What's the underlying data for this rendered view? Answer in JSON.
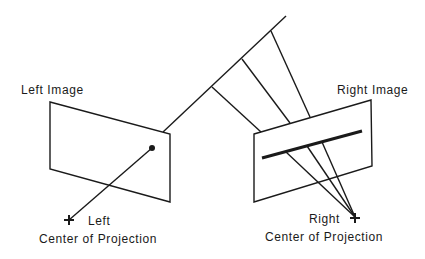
{
  "labels": {
    "left_image": "Left Image",
    "right_image": "Right Image",
    "left_cop_line1": "Left",
    "left_cop_line2": "Center of Projection",
    "right_cop_line1": "Right",
    "right_cop_line2": "Center of Projection"
  },
  "colors": {
    "stroke": "#1a1a1a",
    "background": "#ffffff"
  },
  "geometry": {
    "left_image_quad": [
      [
        50,
        102
      ],
      [
        170,
        134
      ],
      [
        170,
        202
      ],
      [
        50,
        169
      ]
    ],
    "right_image_quad": [
      [
        254,
        134
      ],
      [
        371,
        100
      ],
      [
        372,
        166
      ],
      [
        254,
        202
      ]
    ],
    "scene_line": [
      [
        163,
        132
      ],
      [
        286,
        16
      ]
    ],
    "scene_points": [
      [
        212,
        87
      ],
      [
        242,
        59
      ],
      [
        271,
        31
      ]
    ],
    "right_image_segment": [
      [
        262,
        158
      ],
      [
        362,
        131
      ]
    ],
    "left_cop": [
      69,
      220
    ],
    "right_cop": [
      355,
      217
    ],
    "left_image_point": [
      152,
      148
    ]
  }
}
